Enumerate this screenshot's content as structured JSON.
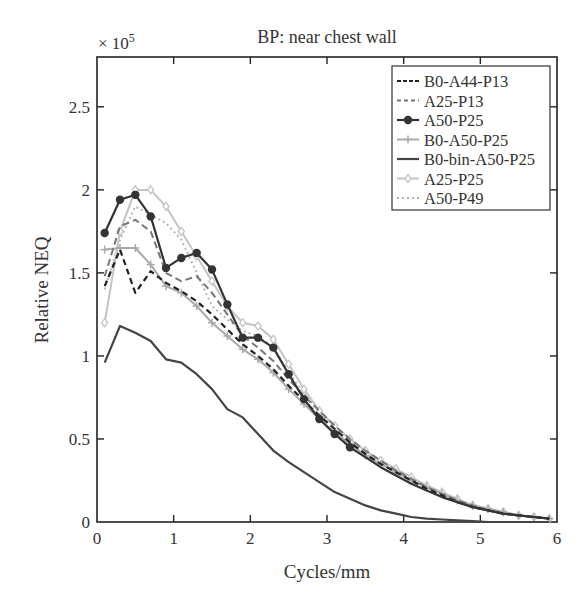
{
  "chart_data": {
    "type": "line",
    "title": "BP: near chest wall",
    "xlabel": "Cycles/mm",
    "ylabel": "Relative NEQ",
    "y_multiplier": "× 10^5",
    "xlim": [
      0,
      6
    ],
    "ylim": [
      0,
      2.8
    ],
    "xticks": [
      0,
      1,
      2,
      3,
      4,
      5,
      6
    ],
    "yticks": [
      0,
      0.5,
      1,
      1.5,
      2,
      2.5
    ],
    "ytick_labels": [
      "0",
      "0.5",
      "1",
      "1.5",
      "2",
      "2.5"
    ],
    "grid": false,
    "legend_position": "upper right",
    "series": [
      {
        "name": "B0-A44-P13",
        "color": "#222222",
        "dash": "6,4",
        "width": 2.2,
        "marker": "none",
        "x": [
          0.1,
          0.3,
          0.5,
          0.7,
          0.9,
          1.1,
          1.3,
          1.5,
          1.7,
          1.9,
          2.1,
          2.3,
          2.5,
          2.7,
          2.9,
          3.1,
          3.3,
          3.5,
          3.7,
          3.9,
          4.1,
          4.3,
          4.5,
          4.7,
          4.9,
          5.1,
          5.3,
          5.5,
          5.7,
          5.9
        ],
        "y": [
          1.42,
          1.64,
          1.38,
          1.51,
          1.44,
          1.39,
          1.33,
          1.25,
          1.16,
          1.07,
          1.0,
          0.92,
          0.82,
          0.73,
          0.64,
          0.56,
          0.48,
          0.41,
          0.35,
          0.3,
          0.25,
          0.2,
          0.16,
          0.12,
          0.09,
          0.07,
          0.05,
          0.04,
          0.03,
          0.02
        ]
      },
      {
        "name": "A25-P13",
        "color": "#777777",
        "dash": "7,4",
        "width": 2,
        "marker": "none",
        "x": [
          0.1,
          0.3,
          0.5,
          0.7,
          0.9,
          1.1,
          1.3,
          1.5,
          1.7,
          1.9,
          2.1,
          2.3,
          2.5,
          2.7,
          2.9,
          3.1,
          3.3,
          3.5,
          3.7,
          3.9,
          4.1,
          4.3,
          4.5,
          4.7,
          4.9,
          5.1,
          5.3,
          5.5,
          5.7,
          5.9
        ],
        "y": [
          1.48,
          1.78,
          1.82,
          1.75,
          1.5,
          1.45,
          1.48,
          1.38,
          1.25,
          1.12,
          1.05,
          0.97,
          0.86,
          0.76,
          0.67,
          0.58,
          0.5,
          0.43,
          0.37,
          0.31,
          0.26,
          0.21,
          0.17,
          0.13,
          0.1,
          0.07,
          0.05,
          0.04,
          0.03,
          0.02
        ]
      },
      {
        "name": "A50-P25",
        "color": "#333333",
        "dash": "",
        "width": 2.2,
        "marker": "dot",
        "x": [
          0.1,
          0.3,
          0.5,
          0.7,
          0.9,
          1.1,
          1.3,
          1.5,
          1.7,
          1.9,
          2.1,
          2.3,
          2.5,
          2.7,
          2.9,
          3.1,
          3.3,
          3.5,
          3.7,
          3.9,
          4.1,
          4.3,
          4.5,
          4.7,
          4.9,
          5.1,
          5.3,
          5.5,
          5.7,
          5.9
        ],
        "y": [
          1.74,
          1.94,
          1.97,
          1.84,
          1.53,
          1.59,
          1.62,
          1.52,
          1.31,
          1.11,
          1.11,
          1.05,
          0.89,
          0.74,
          0.62,
          0.53,
          0.45,
          0.39,
          0.33,
          0.28,
          0.23,
          0.19,
          0.15,
          0.12,
          0.09,
          0.07,
          0.05,
          0.04,
          0.03,
          0.02
        ]
      },
      {
        "name": "B0-A50-P25",
        "color": "#aaaaaa",
        "dash": "",
        "width": 2,
        "marker": "plus",
        "x": [
          0.1,
          0.3,
          0.5,
          0.7,
          0.9,
          1.1,
          1.3,
          1.5,
          1.7,
          1.9,
          2.1,
          2.3,
          2.5,
          2.7,
          2.9,
          3.1,
          3.3,
          3.5,
          3.7,
          3.9,
          4.1,
          4.3,
          4.5,
          4.7,
          4.9,
          5.1,
          5.3,
          5.5,
          5.7,
          5.9
        ],
        "y": [
          1.64,
          1.65,
          1.65,
          1.55,
          1.42,
          1.38,
          1.3,
          1.2,
          1.12,
          1.04,
          0.98,
          0.9,
          0.8,
          0.71,
          0.62,
          0.54,
          0.47,
          0.4,
          0.35,
          0.3,
          0.25,
          0.21,
          0.17,
          0.13,
          0.1,
          0.08,
          0.06,
          0.04,
          0.03,
          0.02
        ]
      },
      {
        "name": "B0-bin-A50-P25",
        "color": "#444444",
        "dash": "",
        "width": 2.2,
        "marker": "none",
        "x": [
          0.1,
          0.3,
          0.5,
          0.7,
          0.9,
          1.1,
          1.3,
          1.5,
          1.7,
          1.9,
          2.1,
          2.3,
          2.5,
          2.7,
          2.9,
          3.1,
          3.3,
          3.5,
          3.7,
          3.9,
          4.1,
          4.3,
          4.5,
          4.7,
          4.9,
          5.1,
          5.3,
          5.5,
          5.7,
          5.9
        ],
        "y": [
          0.96,
          1.18,
          1.14,
          1.09,
          0.98,
          0.96,
          0.89,
          0.8,
          0.68,
          0.63,
          0.53,
          0.43,
          0.36,
          0.3,
          0.24,
          0.18,
          0.14,
          0.1,
          0.07,
          0.05,
          0.03,
          0.02,
          0.015,
          0.01,
          0.005,
          0.0,
          0.0,
          0.0,
          0.0,
          0.0
        ]
      },
      {
        "name": "A25-P25",
        "color": "#c4c4c4",
        "dash": "",
        "width": 2,
        "marker": "diamond",
        "x": [
          0.1,
          0.3,
          0.5,
          0.7,
          0.9,
          1.1,
          1.3,
          1.5,
          1.7,
          1.9,
          2.1,
          2.3,
          2.5,
          2.7,
          2.9,
          3.1,
          3.3,
          3.5,
          3.7,
          3.9,
          4.1,
          4.3,
          4.5,
          4.7,
          4.9,
          5.1,
          5.3,
          5.5,
          5.7,
          5.9
        ],
        "y": [
          1.2,
          1.75,
          2.0,
          2.0,
          1.9,
          1.75,
          1.6,
          1.45,
          1.3,
          1.2,
          1.18,
          1.1,
          0.95,
          0.8,
          0.67,
          0.58,
          0.5,
          0.43,
          0.37,
          0.32,
          0.27,
          0.22,
          0.18,
          0.14,
          0.1,
          0.08,
          0.06,
          0.04,
          0.03,
          0.02
        ]
      },
      {
        "name": "A50-P49",
        "color": "#b0b0b0",
        "dash": "2,3",
        "width": 1.8,
        "marker": "none",
        "x": [
          0.1,
          0.3,
          0.5,
          0.7,
          0.9,
          1.1,
          1.3,
          1.5,
          1.7,
          1.9,
          2.1,
          2.3,
          2.5,
          2.7,
          2.9,
          3.1,
          3.3,
          3.5,
          3.7,
          3.9,
          4.1,
          4.3,
          4.5,
          4.7,
          4.9,
          5.1,
          5.3,
          5.5,
          5.7,
          5.9
        ],
        "y": [
          1.4,
          1.7,
          1.9,
          1.85,
          1.8,
          1.7,
          1.5,
          1.3,
          1.22,
          1.15,
          1.12,
          1.05,
          0.9,
          0.78,
          0.66,
          0.57,
          0.49,
          0.42,
          0.36,
          0.31,
          0.26,
          0.21,
          0.17,
          0.13,
          0.1,
          0.08,
          0.06,
          0.04,
          0.03,
          0.02
        ]
      }
    ]
  },
  "labels": {
    "title": "BP: near chest wall",
    "xlabel": "Cycles/mm",
    "ylabel": "Relative NEQ",
    "multiplier_base": "× 10",
    "multiplier_exp": "5"
  }
}
